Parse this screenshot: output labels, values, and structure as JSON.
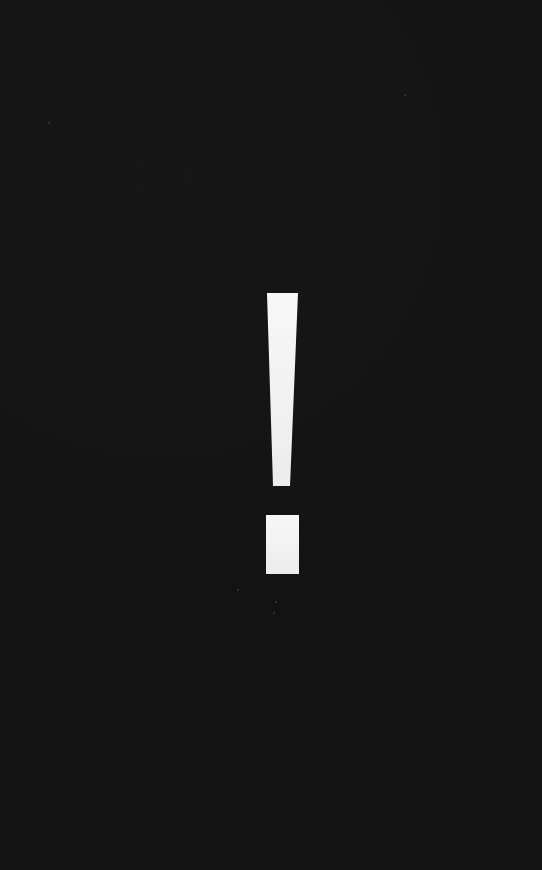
{
  "graphic": {
    "symbol": "!",
    "icon": "exclamation-mark-icon",
    "background_color": "#131313",
    "symbol_color": "#f4f4f4",
    "bar": {
      "top_left": [
        267,
        293
      ],
      "top_right": [
        298,
        293
      ],
      "bottom_right": [
        290,
        486
      ],
      "bottom_left": [
        273,
        486
      ]
    },
    "dot": {
      "x": 266,
      "y": 515,
      "width": 33,
      "height": 59
    }
  }
}
